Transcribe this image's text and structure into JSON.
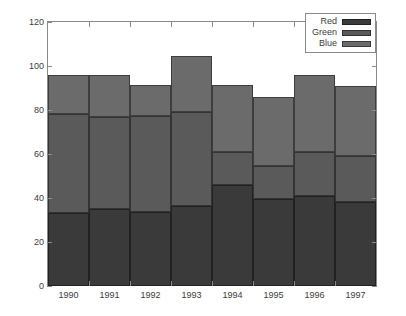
{
  "chart_data": {
    "type": "bar",
    "stacked": true,
    "title": "",
    "subtitle": "",
    "xlabel": "",
    "ylabel": "",
    "categories": [
      "1990",
      "1991",
      "1992",
      "1993",
      "1994",
      "1995",
      "1996",
      "1997"
    ],
    "series": [
      {
        "name": "Red",
        "color": "#3a3a3a",
        "values": [
          33,
          35,
          33.5,
          36.5,
          46,
          39.5,
          41,
          38
        ]
      },
      {
        "name": "Green",
        "color": "#5a5a5a",
        "values": [
          45,
          42,
          44,
          42.5,
          15,
          15,
          20,
          21
        ]
      },
      {
        "name": "Blue",
        "color": "#6b6b6b",
        "values": [
          18,
          19,
          14,
          25.5,
          30.5,
          31.5,
          35,
          32
        ]
      }
    ],
    "totals": [
      96,
      96,
      91.5,
      104.5,
      91.5,
      86,
      96,
      91
    ],
    "ylim": [
      0,
      120
    ],
    "yticks": [
      0,
      20,
      40,
      60,
      80,
      100,
      120
    ],
    "ytick_labels": [
      "0",
      "20",
      "40",
      "60",
      "80",
      "100",
      "120"
    ],
    "grid": false,
    "legend_position": "top-right",
    "legend_entries": [
      "Red",
      "Green",
      "Blue"
    ],
    "bar_gap": 0,
    "axis_color": "#8a8a8a",
    "text_color": "#3c3c3c",
    "background": "#ffffff"
  }
}
